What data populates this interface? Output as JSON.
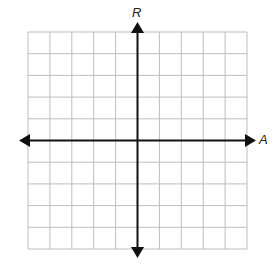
{
  "diagram": {
    "type": "coordinate-grid",
    "columns": 10,
    "rows": 10,
    "vertical_axis_label": "R",
    "horizontal_axis_label": "A",
    "grid_color": "#b8b8b8",
    "axis_color": "#111111"
  }
}
